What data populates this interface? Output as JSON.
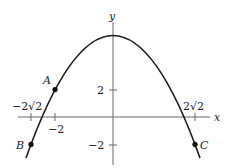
{
  "diagram": {
    "function": "y = 6 - x^2",
    "axes": {
      "x_label": "x",
      "y_label": "y"
    },
    "ticks": {
      "x": [
        {
          "value": -2.828,
          "label": "−2√2",
          "label_pos": "above"
        },
        {
          "value": -2,
          "label": "−2",
          "label_pos": "below"
        },
        {
          "value": 2.828,
          "label": "2√2",
          "label_pos": "above"
        }
      ],
      "y": [
        {
          "value": 2,
          "label": "2"
        },
        {
          "value": -2,
          "label": "−2"
        }
      ]
    },
    "points": [
      {
        "name": "A",
        "x": -2,
        "y": 2
      },
      {
        "name": "B",
        "x": -2.828,
        "y": -2
      },
      {
        "name": "C",
        "x": 2.828,
        "y": -2
      }
    ],
    "colors": {
      "stroke": "#1a1a1a",
      "axis": "#555555"
    }
  }
}
